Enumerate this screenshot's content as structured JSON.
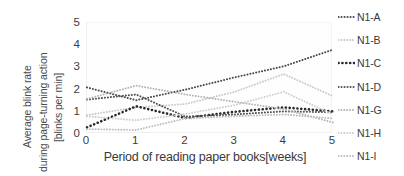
{
  "chart_data": {
    "type": "line",
    "title": "",
    "xlabel": "Period of reading paper books[weeks]",
    "ylabel_lines": [
      "Average blink rate",
      "during page-turning action",
      "[blinks per min]"
    ],
    "ylabel": "Average blink rate during page-turning action [blinks per min]",
    "x": [
      0,
      1,
      2,
      3,
      4,
      5
    ],
    "xticks": [
      "0",
      "1",
      "2",
      "3",
      "4",
      "5"
    ],
    "yticks": [
      "0",
      "1",
      "2",
      "3",
      "4",
      "5"
    ],
    "xlim": [
      0,
      5
    ],
    "ylim": [
      0,
      5
    ],
    "grid": false,
    "legend_position": "right",
    "line_style": "dotted",
    "series": [
      {
        "name": "N1-A",
        "color": "#4a4a4a",
        "width": 2.0,
        "values": [
          2.1,
          1.52,
          2.0,
          2.55,
          3.05,
          3.8
        ]
      },
      {
        "name": "N1-B",
        "color": "#c8c8c8",
        "width": 1.9,
        "values": [
          0.85,
          1.2,
          1.35,
          1.9,
          2.7,
          1.7
        ]
      },
      {
        "name": "N1-C",
        "color": "#2b2b2b",
        "width": 2.6,
        "values": [
          0.3,
          1.25,
          0.72,
          1.0,
          1.2,
          1.02
        ]
      },
      {
        "name": "N1-D",
        "color": "#555555",
        "width": 2.0,
        "values": [
          1.55,
          1.78,
          0.78,
          0.88,
          1.02,
          0.98
        ]
      },
      {
        "name": "N1-G",
        "color": "#b4b4b4",
        "width": 1.9,
        "values": [
          1.58,
          2.18,
          1.78,
          1.45,
          1.12,
          0.52
        ]
      },
      {
        "name": "N1-H",
        "color": "#cfcfcf",
        "width": 1.9,
        "values": [
          0.8,
          0.62,
          0.9,
          1.3,
          1.9,
          0.88
        ]
      },
      {
        "name": "N1-I",
        "color": "#bdbdbd",
        "width": 1.9,
        "values": [
          0.22,
          0.18,
          0.7,
          0.8,
          0.88,
          0.7
        ]
      }
    ]
  },
  "legend": {
    "items": [
      {
        "label": "N1-A"
      },
      {
        "label": "N1-B"
      },
      {
        "label": "N1-C"
      },
      {
        "label": "N1-D"
      },
      {
        "label": "N1-G"
      },
      {
        "label": "N1-H"
      },
      {
        "label": "N1-I"
      }
    ]
  }
}
